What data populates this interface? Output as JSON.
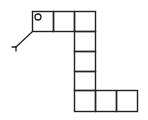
{
  "figure": {
    "stroke_color": "#222222",
    "background": "#ffffff",
    "cell_size": 21,
    "cells": [
      {
        "x": 32,
        "y": 11
      },
      {
        "x": 53,
        "y": 11
      },
      {
        "x": 74,
        "y": 11
      },
      {
        "x": 74,
        "y": 31
      },
      {
        "x": 74,
        "y": 51
      },
      {
        "x": 74,
        "y": 71
      },
      {
        "x": 74,
        "y": 90
      },
      {
        "x": 95,
        "y": 90
      },
      {
        "x": 116,
        "y": 90
      }
    ],
    "eye": {
      "cx": 38,
      "cy": 17,
      "r": 3
    },
    "tongue": {
      "stem": {
        "x1": 32,
        "y1": 32,
        "x2": 16,
        "y2": 47
      },
      "fork_left": {
        "x1": 16,
        "y1": 47,
        "x2": 12,
        "y2": 47
      },
      "fork_down": {
        "x1": 16,
        "y1": 47,
        "x2": 16,
        "y2": 51
      }
    }
  }
}
